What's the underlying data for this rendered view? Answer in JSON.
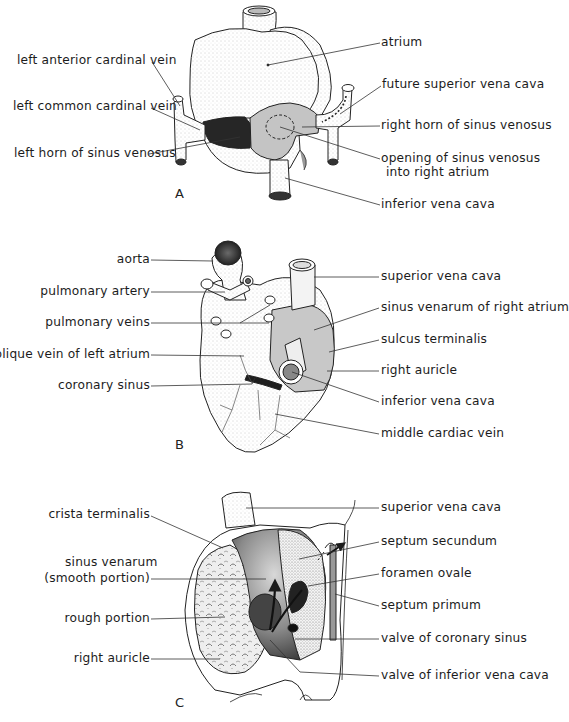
{
  "panels": [
    {
      "letter": "A",
      "labels_left": [
        "left anterior cardinal vein",
        "left common cardinal vein",
        "left horn of sinus venosus"
      ],
      "labels_right": [
        "atrium",
        "future superior vena cava",
        "right horn of sinus venosus",
        "opening of sinus venosus",
        "into right atrium",
        "inferior vena cava"
      ]
    },
    {
      "letter": "B",
      "labels_left": [
        "aorta",
        "pulmonary artery",
        "pulmonary veins",
        "oblique vein of left atrium",
        "coronary sinus"
      ],
      "labels_right": [
        "superior vena cava",
        "sinus venarum of right atrium",
        "sulcus terminalis",
        "right auricle",
        "inferior vena cava",
        "middle cardiac vein"
      ]
    },
    {
      "letter": "C",
      "labels_left": [
        "crista terminalis",
        "sinus venarum",
        "(smooth portion)",
        "rough portion",
        "right auricle"
      ],
      "labels_right": [
        "superior vena cava",
        "septum secundum",
        "foramen ovale",
        "septum primum",
        "valve of coronary sinus",
        "valve of inferior vena cava"
      ]
    }
  ],
  "colors": {
    "ink": "#1c1c1c",
    "shade_light": "#c9c9c9",
    "shade_dark": "#2a2a2a",
    "paper": "#ffffff"
  }
}
